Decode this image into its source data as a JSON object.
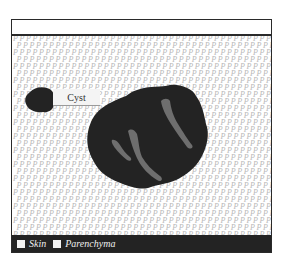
{
  "diagram": {
    "labels": {
      "cyst": "Cyst"
    },
    "legend": {
      "items": [
        {
          "label": "Skin",
          "swatch_color": "#f2f2f2"
        },
        {
          "label": "Parenchyma",
          "swatch_color": "#f2f2f2"
        }
      ]
    },
    "pattern": {
      "glyph": "P",
      "color": "#b8b8b8"
    },
    "colors": {
      "frame": "#2a2a2a",
      "mass": "#232323",
      "streaks": "#6e6e6e",
      "legend_bar": "#232323",
      "background": "#ffffff"
    }
  }
}
